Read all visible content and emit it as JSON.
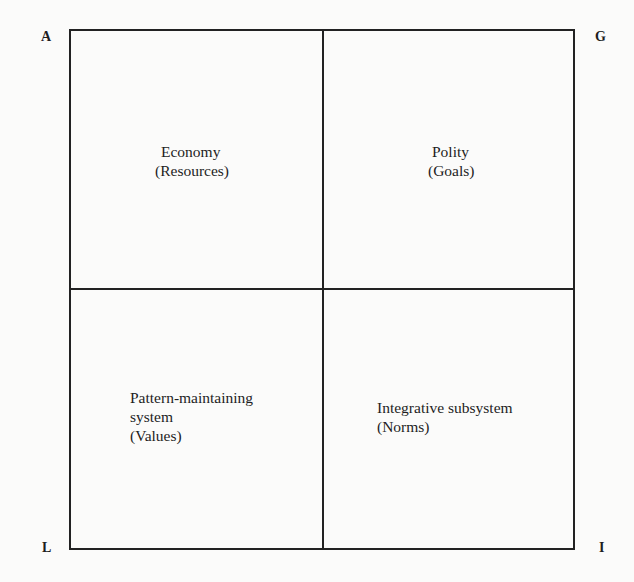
{
  "diagram": {
    "type": "AGIL quadrant diagram",
    "corners": {
      "top_left": "A",
      "top_right": "G",
      "bottom_left": "L",
      "bottom_right": "I"
    },
    "quadrants": {
      "top_left": {
        "lines": [
          "Economy",
          "(Resources)"
        ]
      },
      "top_right": {
        "lines": [
          "Polity",
          "(Goals)"
        ]
      },
      "bottom_left": {
        "lines": [
          "Pattern-maintaining",
          "system",
          "(Values)"
        ]
      },
      "bottom_right": {
        "lines": [
          "Integrative subsystem",
          "(Norms)"
        ]
      }
    },
    "colors": {
      "lines": "#222222",
      "text": "#1e1e1e",
      "background": "#fbfbfa"
    }
  }
}
